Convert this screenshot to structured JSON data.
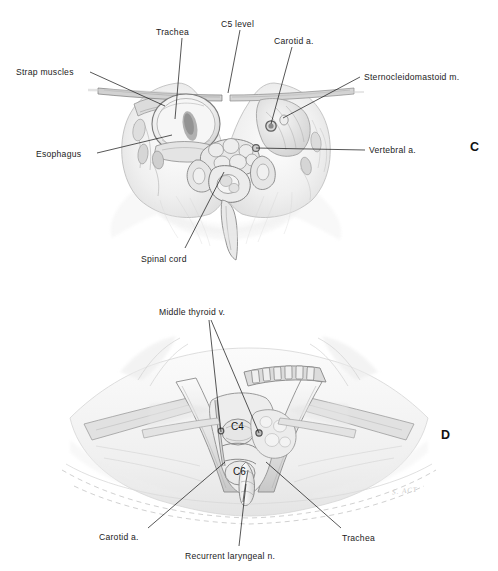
{
  "figure": {
    "background_color": "#ffffff",
    "ink_color": "#1b1b1b",
    "panels": [
      {
        "letter": "C",
        "letter_x": 470,
        "letter_y": 141,
        "caption_kind": "axial-cross-section",
        "labels": [
          {
            "text": "Trachea",
            "x": 156,
            "y": 28,
            "align": "left",
            "lx1": 182,
            "ly1": 38,
            "lx2": 175,
            "ly2": 119
          },
          {
            "text": "C5 level",
            "x": 221,
            "y": 20,
            "align": "left",
            "lx1": 240,
            "ly1": 30,
            "lx2": 228,
            "ly2": 93
          },
          {
            "text": "Carotid a.",
            "x": 274,
            "y": 37,
            "align": "left",
            "lx1": 292,
            "ly1": 47,
            "lx2": 271,
            "ly2": 124
          },
          {
            "text": "Strap muscles",
            "x": 16,
            "y": 68,
            "align": "left",
            "lx1": 90,
            "ly1": 72,
            "lx2": 165,
            "ly2": 106
          },
          {
            "text": "Sternocleidomastoid m.",
            "x": 364,
            "y": 73,
            "align": "left",
            "lx1": 360,
            "ly1": 77,
            "lx2": 283,
            "ly2": 118
          },
          {
            "text": "Esophagus",
            "x": 36,
            "y": 150,
            "align": "left",
            "lx1": 97,
            "ly1": 153,
            "lx2": 172,
            "ly2": 135
          },
          {
            "text": "Vertebral a.",
            "x": 369,
            "y": 146,
            "align": "left",
            "lx1": 365,
            "ly1": 150,
            "lx2": 256,
            "ly2": 148
          },
          {
            "text": "Spinal cord",
            "x": 141,
            "y": 255,
            "align": "left",
            "lx1": 185,
            "ly1": 248,
            "lx2": 224,
            "ly2": 172
          }
        ]
      },
      {
        "letter": "D",
        "letter_x": 441,
        "letter_y": 429,
        "caption_kind": "surgical-exposure",
        "structure_labels": [
          {
            "text": "C4",
            "x": 231,
            "y": 422
          },
          {
            "text": "C6",
            "x": 233,
            "y": 467
          }
        ],
        "labels": [
          {
            "text": "Middle thyroid v.",
            "x": 159,
            "y": 308,
            "align": "left",
            "lx1": 209,
            "ly1": 320,
            "lx2": 221,
            "ly2": 432
          },
          {
            "text": "Carotid a.",
            "x": 99,
            "y": 533,
            "align": "left",
            "lx1": 148,
            "ly1": 528,
            "lx2": 225,
            "ly2": 462
          },
          {
            "text": "Recurrent  laryngeal  n.",
            "x": 185,
            "y": 552,
            "align": "left",
            "lx1": 239,
            "ly1": 546,
            "lx2": 246,
            "ly2": 484
          },
          {
            "text": "Trachea",
            "x": 342,
            "y": 534,
            "align": "left",
            "lx1": 341,
            "ly1": 528,
            "lx2": 266,
            "ly2": 462
          }
        ],
        "extra_leaders": [
          {
            "lx1": 211,
            "ly1": 320,
            "lx2": 259,
            "ly2": 433
          }
        ],
        "signature": {
          "text": "S. ACT",
          "x": 392,
          "y": 487
        }
      }
    ]
  },
  "art": {
    "stroke_dark": "#4a4a4a",
    "stroke_mid": "#8e8e8e",
    "stroke_light": "#c4c4c4",
    "stroke_faint": "#e2e2e2",
    "fill_pale": "#f4f4f4",
    "fill_soft": "#e9e9e9",
    "fill_mid": "#dadada"
  }
}
